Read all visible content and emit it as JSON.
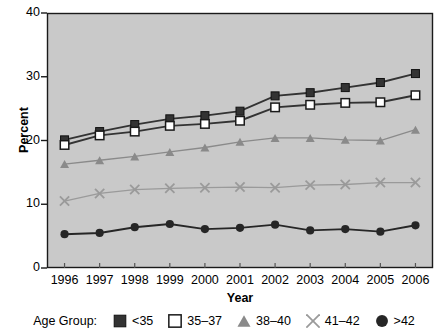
{
  "chart_data": {
    "type": "line",
    "title": "",
    "xlabel": "Year",
    "ylabel": "Percent",
    "categories": [
      "1996",
      "1997",
      "1998",
      "1999",
      "2000",
      "2001",
      "2002",
      "2003",
      "2004",
      "2005",
      "2006"
    ],
    "ylim": [
      0,
      40
    ],
    "yticks": [
      0,
      10,
      20,
      30,
      40
    ],
    "grid": false,
    "legend_position": "bottom",
    "legend_title": "Age Group:",
    "series": [
      {
        "name": "<35",
        "marker": "filled-square",
        "color": "#333333",
        "values": [
          20.1,
          21.4,
          22.5,
          23.4,
          23.9,
          24.6,
          27.0,
          27.5,
          28.3,
          29.1,
          30.5
        ]
      },
      {
        "name": "35–37",
        "marker": "open-square",
        "color": "#333333",
        "values": [
          19.3,
          20.8,
          21.4,
          22.3,
          22.6,
          23.1,
          25.2,
          25.6,
          25.9,
          26.0,
          27.1
        ]
      },
      {
        "name": "38–40",
        "marker": "filled-triangle",
        "color": "#8a8a8a",
        "values": [
          16.3,
          16.9,
          17.5,
          18.2,
          18.9,
          19.8,
          20.4,
          20.4,
          20.1,
          20.0,
          21.7
        ]
      },
      {
        "name": "41–42",
        "marker": "x-cross",
        "color": "#9a9a9a",
        "values": [
          10.5,
          11.7,
          12.3,
          12.5,
          12.6,
          12.7,
          12.6,
          13.0,
          13.1,
          13.4,
          13.4
        ]
      },
      {
        "name": ">42",
        "marker": "filled-circle",
        "color": "#262626",
        "values": [
          5.3,
          5.5,
          6.4,
          6.9,
          6.1,
          6.3,
          6.8,
          5.9,
          6.1,
          5.7,
          6.7
        ]
      }
    ]
  },
  "axes": {
    "ytick_labels": [
      "40",
      "30",
      "20",
      "10",
      "0"
    ],
    "xtick_labels": [
      "1996",
      "1997",
      "1998",
      "1999",
      "2000",
      "2001",
      "2002",
      "2003",
      "2004",
      "2005",
      "2006"
    ],
    "ylabel": "Percent",
    "xlabel": "Year"
  },
  "legend": {
    "title": "Age Group:",
    "items": [
      {
        "label": "<35",
        "icon": "filled-square-icon"
      },
      {
        "label": "35–37",
        "icon": "open-square-icon"
      },
      {
        "label": "38–40",
        "icon": "filled-triangle-icon"
      },
      {
        "label": "41–42",
        "icon": "x-cross-icon"
      },
      {
        "label": ">42",
        "icon": "filled-circle-icon"
      }
    ]
  },
  "colors": {
    "plot_background": "#c9c9c9",
    "page_background": "#ffffff",
    "axis": "#1a1a1a",
    "series_dark": "#333333",
    "series_mid_gray": "#8a8a8a",
    "series_light_gray": "#9a9a9a",
    "series_black": "#262626"
  }
}
